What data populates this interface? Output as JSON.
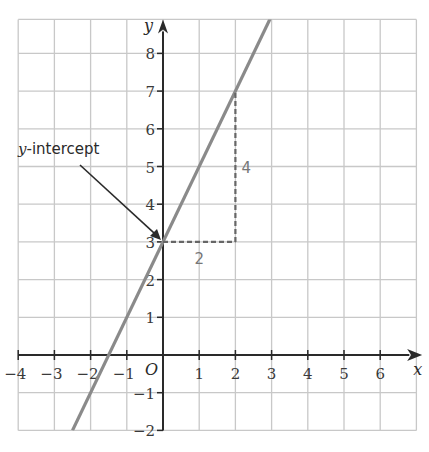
{
  "chart_data": {
    "type": "line",
    "title": "",
    "xlabel": "x",
    "ylabel": "y",
    "xlim": [
      -4,
      7
    ],
    "ylim": [
      -2,
      8.9
    ],
    "grid": true,
    "origin_label": "O",
    "x_ticks": [
      -4,
      -3,
      -2,
      -1,
      1,
      2,
      3,
      4,
      5,
      6
    ],
    "x_tick_labels": [
      "−4",
      "−3",
      "−2",
      "−1",
      "1",
      "2",
      "3",
      "4",
      "5",
      "6"
    ],
    "y_ticks": [
      -2,
      -1,
      1,
      2,
      3,
      4,
      5,
      6,
      7,
      8
    ],
    "y_tick_labels": [
      "−2",
      "−1",
      "1",
      "2",
      "3",
      "4",
      "5",
      "6",
      "7",
      "8"
    ],
    "series": [
      {
        "name": "y = 2x + 3",
        "slope": 2,
        "intercept": 3,
        "x": [
          -2.5,
          3
        ],
        "y": [
          -2,
          9
        ]
      }
    ],
    "annotations": [
      {
        "text_italic": "y",
        "text": "-intercept",
        "points_to": [
          0,
          3
        ]
      },
      {
        "text": "2",
        "type": "run",
        "from": [
          0,
          3
        ],
        "to": [
          2,
          3
        ]
      },
      {
        "text": "4",
        "type": "rise",
        "from": [
          2,
          3
        ],
        "to": [
          2,
          7
        ]
      }
    ]
  },
  "labels": {
    "x_axis": "x",
    "y_axis": "y",
    "origin": "O",
    "intercept_italic": "y",
    "intercept_rest": "-intercept",
    "run": "2",
    "rise": "4"
  },
  "colors": {
    "grid": "#c8c8c8",
    "axis": "#2a2a2a",
    "line": "#8a8a8a",
    "dashed": "#666666",
    "arrow": "#2a2a2a"
  }
}
